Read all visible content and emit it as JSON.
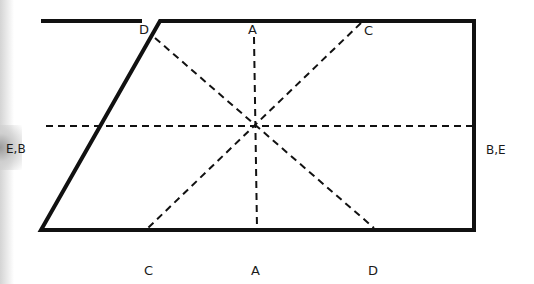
{
  "diagram": {
    "colors": {
      "stroke": "#111111",
      "background": "#ffffff"
    },
    "labels": {
      "top_d": "D",
      "top_a": "A",
      "top_c": "C",
      "left_eb": "E,B",
      "right_be": "B,E",
      "bottom_c": "C",
      "bottom_a": "A",
      "bottom_d": "D"
    },
    "lines": [
      {
        "name": "A-A",
        "type": "vertical",
        "style": "dashed"
      },
      {
        "name": "B,E-B,E",
        "type": "horizontal",
        "style": "dashed"
      },
      {
        "name": "C-C",
        "type": "diagonal",
        "style": "dashed"
      },
      {
        "name": "D-D",
        "type": "diagonal",
        "style": "dashed"
      }
    ]
  }
}
